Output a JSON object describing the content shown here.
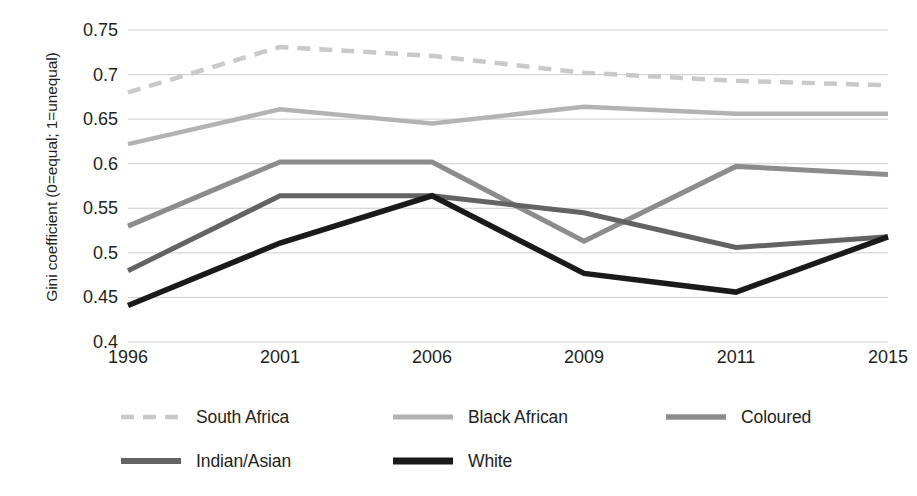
{
  "chart_data": {
    "type": "line",
    "title": "",
    "xlabel": "",
    "ylabel": "Gini coefficient (0=equal; 1=unequal)",
    "categories": [
      "1996",
      "2001",
      "2006",
      "2009",
      "2011",
      "2015"
    ],
    "x_tick_labels": [
      "1996",
      "2001",
      "2006",
      "2009",
      "2011",
      "2015"
    ],
    "y_tick_labels": [
      "0.75",
      "0.7",
      "0.65",
      "0.6",
      "0.55",
      "0.5",
      "0.45",
      "0.4"
    ],
    "y_tick_values": [
      0.75,
      0.7,
      0.65,
      0.6,
      0.55,
      0.5,
      0.45,
      0.4
    ],
    "ylim": [
      0.4,
      0.75
    ],
    "grid": true,
    "grid_axis": "y",
    "legend_position": "bottom",
    "series": [
      {
        "name": "South Africa",
        "values": [
          0.68,
          0.731,
          0.721,
          0.702,
          0.693,
          0.688
        ],
        "color": "#c9c9c9",
        "style": "dashed",
        "width": 4.5,
        "dasharray": "13,9"
      },
      {
        "name": "Black African",
        "values": [
          0.622,
          0.661,
          0.645,
          0.664,
          0.656,
          0.656
        ],
        "color": "#b3b3b3",
        "style": "solid",
        "width": 4.5,
        "dasharray": ""
      },
      {
        "name": "Coloured",
        "values": [
          0.53,
          0.602,
          0.602,
          0.513,
          0.597,
          0.588
        ],
        "color": "#8c8c8c",
        "style": "solid",
        "width": 5,
        "dasharray": ""
      },
      {
        "name": "Indian/Asian",
        "values": [
          0.48,
          0.564,
          0.564,
          0.545,
          0.506,
          0.518
        ],
        "color": "#636363",
        "style": "solid",
        "width": 5,
        "dasharray": ""
      },
      {
        "name": "White",
        "values": [
          0.441,
          0.511,
          0.564,
          0.477,
          0.456,
          0.518
        ],
        "color": "#1a1a1a",
        "style": "solid",
        "width": 5.5,
        "dasharray": ""
      }
    ],
    "legend_entries": [
      {
        "label": "South Africa",
        "color": "#c9c9c9",
        "dasharray": "13,9",
        "width": 4.5
      },
      {
        "label": "Black African",
        "color": "#b3b3b3",
        "dasharray": "",
        "width": 5
      },
      {
        "label": "Coloured",
        "color": "#8c8c8c",
        "dasharray": "",
        "width": 5.5
      },
      {
        "label": "Indian/Asian",
        "color": "#636363",
        "dasharray": "",
        "width": 6
      },
      {
        "label": "White",
        "color": "#1a1a1a",
        "dasharray": "",
        "width": 7
      }
    ],
    "grid_color": "#c8c8c8",
    "background": "#ffffff"
  }
}
